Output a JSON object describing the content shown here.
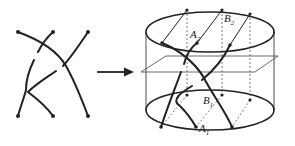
{
  "diagram": {
    "left_braid": {
      "strands": 3,
      "description": "planar braid diagram with three strands and crossings"
    },
    "arrow": {
      "direction": "right"
    },
    "cylinder": {
      "labels": {
        "A2": {
          "base": "A",
          "sub": "2"
        },
        "B2": {
          "base": "B",
          "sub": "2"
        },
        "B1": {
          "base": "B",
          "sub": "1"
        },
        "A1": {
          "base": "A",
          "sub": "1"
        }
      }
    },
    "colors": {
      "stroke": "#222222",
      "thin": "#444444",
      "background": "#ffffff"
    }
  }
}
